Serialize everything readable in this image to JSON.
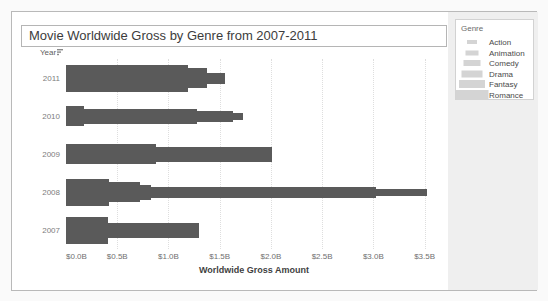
{
  "chart_data": {
    "type": "bar",
    "title": "Movie Worldwide Gross by Genre from 2007-2011",
    "xlabel": "Worldwide Gross Amount",
    "y_field_label": "Year",
    "legend": {
      "title": "Genre",
      "items": [
        "Action",
        "Animation",
        "Comedy",
        "Drama",
        "Fantasy",
        "Romance"
      ]
    },
    "genre_sizes": {
      "Action": 4,
      "Animation": 7,
      "Comedy": 11,
      "Drama": 15,
      "Fantasy": 20,
      "Romance": 27
    },
    "x_ticks": [
      {
        "label": "$0.0B",
        "value": 0.0
      },
      {
        "label": "$0.5B",
        "value": 0.5
      },
      {
        "label": "$1.0B",
        "value": 1.0
      },
      {
        "label": "$1.5B",
        "value": 1.5
      },
      {
        "label": "$2.0B",
        "value": 2.0
      },
      {
        "label": "$2.5B",
        "value": 2.5
      },
      {
        "label": "$3.0B",
        "value": 3.0
      },
      {
        "label": "$3.5B",
        "value": 3.5
      }
    ],
    "xlim": [
      0,
      3.67
    ],
    "grid": "vertical-dotted",
    "bar_color": "#5a5a5a",
    "legend_swatch_color": "#d4d4d4",
    "rows": [
      {
        "year": "2011",
        "bars": [
          {
            "genre": "Romance",
            "value": 1.19
          },
          {
            "genre": "Fantasy",
            "value": 1.38
          },
          {
            "genre": "Comedy",
            "value": 1.55
          }
        ]
      },
      {
        "year": "2010",
        "bars": [
          {
            "genre": "Fantasy",
            "value": 0.18
          },
          {
            "genre": "Drama",
            "value": 1.28
          },
          {
            "genre": "Comedy",
            "value": 1.63
          },
          {
            "genre": "Animation",
            "value": 1.73
          }
        ]
      },
      {
        "year": "2009",
        "bars": [
          {
            "genre": "Fantasy",
            "value": 0.88
          },
          {
            "genre": "Drama",
            "value": 2.01
          }
        ]
      },
      {
        "year": "2008",
        "bars": [
          {
            "genre": "Romance",
            "value": 0.42
          },
          {
            "genre": "Fantasy",
            "value": 0.72
          },
          {
            "genre": "Drama",
            "value": 0.83
          },
          {
            "genre": "Comedy",
            "value": 3.03
          },
          {
            "genre": "Animation",
            "value": 3.52
          }
        ]
      },
      {
        "year": "2007",
        "bars": [
          {
            "genre": "Romance",
            "value": 0.41
          },
          {
            "genre": "Drama",
            "value": 1.3
          }
        ]
      }
    ]
  }
}
